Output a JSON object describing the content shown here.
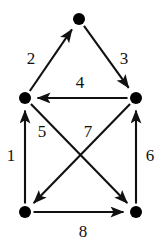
{
  "figure": {
    "type": "directed-graph",
    "background_color": "#ffffff",
    "node_color": "#000000",
    "edge_color": "#111111",
    "label_color": "#111111",
    "node_radius": 6,
    "width": 163,
    "height": 245
  },
  "nodes": [
    {
      "id": "top",
      "name": "node-top",
      "x": 79,
      "y": 19
    },
    {
      "id": "left-middle",
      "name": "node-left-middle",
      "x": 25,
      "y": 98
    },
    {
      "id": "right-middle",
      "name": "node-right-middle",
      "x": 136,
      "y": 98
    },
    {
      "id": "bottom-left",
      "name": "node-bottom-left",
      "x": 25,
      "y": 212
    },
    {
      "id": "bottom-right",
      "name": "node-bottom-right",
      "x": 136,
      "y": 212
    }
  ],
  "edges": [
    {
      "label": "1",
      "from": "bottom-left",
      "to": "left-middle",
      "label_x": 11,
      "label_y": 155,
      "direction": "up"
    },
    {
      "label": "2",
      "from": "left-middle",
      "to": "top",
      "label_x": 31,
      "label_y": 58,
      "direction": "up-right"
    },
    {
      "label": "3",
      "from": "top",
      "to": "right-middle",
      "label_x": 124,
      "label_y": 58,
      "direction": "down-right"
    },
    {
      "label": "4",
      "from": "right-middle",
      "to": "left-middle",
      "label_x": 80,
      "label_y": 82,
      "direction": "left"
    },
    {
      "label": "5",
      "from": "left-middle",
      "to": "bottom-right",
      "label_x": 42,
      "label_y": 131,
      "direction": "down-right"
    },
    {
      "label": "6",
      "from": "bottom-right",
      "to": "right-middle",
      "label_x": 150,
      "label_y": 155,
      "direction": "up"
    },
    {
      "label": "7",
      "from": "right-middle",
      "to": "bottom-left",
      "label_x": 88,
      "label_y": 131,
      "direction": "down-left"
    },
    {
      "label": "8",
      "from": "bottom-left",
      "to": "bottom-right",
      "label_x": 83,
      "label_y": 231,
      "direction": "right"
    }
  ]
}
